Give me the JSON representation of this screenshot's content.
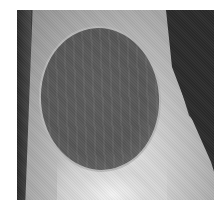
{
  "image": {
    "description": "Grayscale radiograph showing a bone with a large oval radiolucent lesion",
    "colors": {
      "background": "#ffffff",
      "soft_tissue_dark": "#2b2b2b",
      "bone_light": "#c8c8c8",
      "lesion_dark": "#565656",
      "lesion_rim": "#b8b8b8"
    }
  }
}
